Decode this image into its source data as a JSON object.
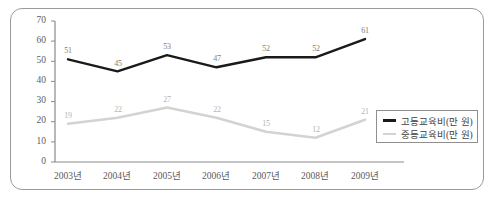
{
  "chart_data": {
    "type": "line",
    "title": "",
    "xlabel": "",
    "ylabel": "",
    "ylim": [
      0,
      70
    ],
    "ytick_step": 10,
    "yticks": [
      "0",
      "10",
      "20",
      "30",
      "40",
      "50",
      "60",
      "70"
    ],
    "grid": false,
    "legend_position": "bottom-right",
    "categories": [
      "2003년",
      "2004년",
      "2005년",
      "2006년",
      "2007년",
      "2008년",
      "2009년"
    ],
    "series": [
      {
        "name": "고등교육비(만 원)",
        "color": "#1a1a1a",
        "values": [
          51,
          45,
          53,
          47,
          52,
          52,
          61
        ],
        "labels": [
          "51",
          "45",
          "53",
          "47",
          "52",
          "52",
          "61"
        ]
      },
      {
        "name": "중등교육비(만 원)",
        "color": "#d3d3d3",
        "values": [
          19,
          22,
          27,
          22,
          15,
          12,
          21
        ],
        "labels": [
          "19",
          "22",
          "27",
          "22",
          "15",
          "12",
          "21"
        ]
      }
    ]
  },
  "colors": {
    "series_high": "#1a1a1a",
    "series_mid": "#d3d3d3",
    "axis": "#8a8a8a",
    "frame": "#9a9a9a",
    "background": "#ffffff"
  }
}
